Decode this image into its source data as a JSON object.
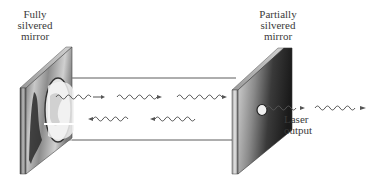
{
  "diagram": {
    "labels": {
      "left_mirror": [
        "Fully",
        "silvered",
        "mirror"
      ],
      "right_mirror": [
        "Partially",
        "silvered",
        "mirror"
      ],
      "output": [
        "Laser",
        "output"
      ]
    },
    "components": [
      {
        "name": "fully-silvered-mirror",
        "position": "left"
      },
      {
        "name": "laser-tube",
        "position": "center"
      },
      {
        "name": "partially-silvered-mirror",
        "position": "right",
        "feature": "central aperture"
      }
    ],
    "waves": {
      "forward_row": {
        "direction": "right",
        "count": 3
      },
      "backward_row": {
        "direction": "left",
        "count": 3
      },
      "output": {
        "direction": "right",
        "count": 2
      }
    },
    "colors": {
      "line": "#8a8a8a",
      "wave": "#555555",
      "text": "#3a3a3a",
      "mirror_dark": "#2a2a2a",
      "mirror_light": "#d8d8d8"
    }
  }
}
